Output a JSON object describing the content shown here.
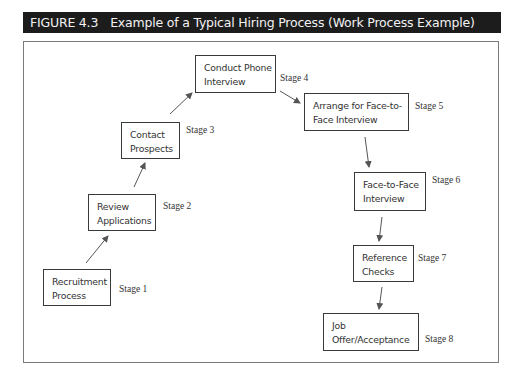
{
  "figure": {
    "number": "FIGURE 4.3",
    "title": "Example of a Typical Hiring Process (Work Process Example)"
  },
  "stages": [
    {
      "id": 1,
      "line1": "Recruitment",
      "line2": "Process",
      "stage_label": "Stage 1"
    },
    {
      "id": 2,
      "line1": "Review",
      "line2": "Applications",
      "stage_label": "Stage 2"
    },
    {
      "id": 3,
      "line1": "Contact",
      "line2": "Prospects",
      "stage_label": "Stage 3"
    },
    {
      "id": 4,
      "line1": "Conduct Phone",
      "line2": "Interview",
      "stage_label": "Stage 4"
    },
    {
      "id": 5,
      "line1": "Arrange for Face-to-",
      "line2": "Face Interview",
      "stage_label": "Stage 5"
    },
    {
      "id": 6,
      "line1": "Face-to-Face",
      "line2": "Interview",
      "stage_label": "Stage 6"
    },
    {
      "id": 7,
      "line1": "Reference",
      "line2": "Checks",
      "stage_label": "Stage 7"
    },
    {
      "id": 8,
      "line1": "Job",
      "line2": "Offer/Acceptance",
      "stage_label": "Stage 8"
    }
  ],
  "connections": [
    {
      "from": 1,
      "to": 2
    },
    {
      "from": 2,
      "to": 3
    },
    {
      "from": 3,
      "to": 4
    },
    {
      "from": 4,
      "to": 5
    },
    {
      "from": 5,
      "to": 6
    },
    {
      "from": 6,
      "to": 7
    },
    {
      "from": 7,
      "to": 8
    }
  ],
  "colors": {
    "title_bar_bg": "#1c1c1c",
    "title_text": "#f2f2f2",
    "box_border": "#3a3a3a",
    "arrow": "#555555"
  }
}
